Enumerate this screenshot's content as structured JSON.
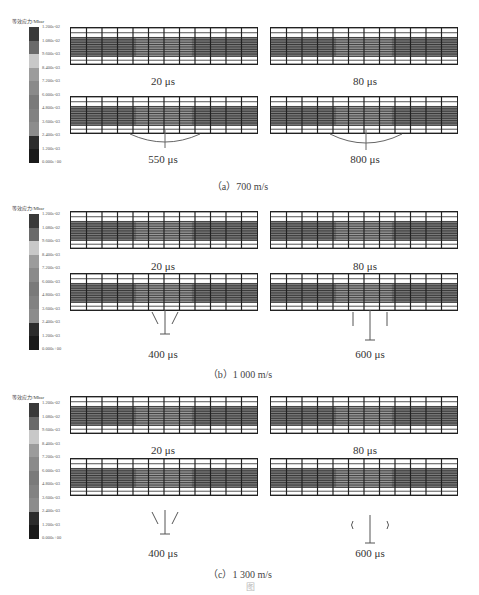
{
  "legend": {
    "title": "等效应力/Mbar",
    "ticks": [
      "1.200e-02",
      "1.080e-02",
      "9.600e-03",
      "8.400e-03",
      "7.200e-03",
      "6.000e-03",
      "4.800e-03",
      "3.600e-03",
      "2.400e-03",
      "1.200e-03",
      "0.000e+00"
    ],
    "band_colors": [
      "#3a3a3a",
      "#6a6a6a",
      "#c8c8c8",
      "#9c9c9c",
      "#8a8a8a",
      "#7a7a7a",
      "#828282",
      "#8c8c8c",
      "#2c2c2c",
      "#1a1a1a"
    ]
  },
  "groups": [
    {
      "caption": "（a）700 m/s",
      "panels": [
        {
          "time": "20 μs"
        },
        {
          "time": "80 μs"
        },
        {
          "time": "550 μs"
        },
        {
          "time": "800 μs"
        }
      ]
    },
    {
      "caption": "（b）1 000 m/s",
      "panels": [
        {
          "time": "20 μs"
        },
        {
          "time": "80 μs"
        },
        {
          "time": "400 μs"
        },
        {
          "time": "600 μs"
        }
      ]
    },
    {
      "caption": "（c）1 300 m/s",
      "panels": [
        {
          "time": "20 μs"
        },
        {
          "time": "80 μs"
        },
        {
          "time": "400 μs"
        },
        {
          "time": "600 μs"
        }
      ]
    }
  ],
  "figure_caption": "图"
}
